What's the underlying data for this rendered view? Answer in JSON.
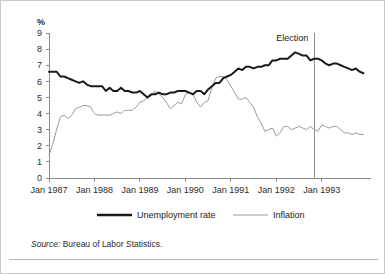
{
  "figure": {
    "y_unit_label": "%",
    "annotation_label": "Election",
    "source_keyword": "Source:",
    "source_text": "Bureau of Labor Statistics."
  },
  "legend": {
    "position": "below-axis",
    "entries": [
      {
        "label": "Unemployment rate",
        "color": "#1a1a1a",
        "style": "thick-solid"
      },
      {
        "label": "Inflation",
        "color": "#9a9a9a",
        "style": "thin-solid"
      }
    ]
  },
  "chart_data": {
    "type": "line",
    "title": "",
    "subtitle": "",
    "xlabel": "",
    "ylabel": "%",
    "ylim": [
      0,
      9
    ],
    "yticks": [
      0,
      1,
      2,
      3,
      4,
      5,
      6,
      7,
      8,
      9
    ],
    "ytick_labels": [
      "0",
      "1",
      "2",
      "3",
      "4",
      "5",
      "6",
      "7",
      "8",
      "9"
    ],
    "xlim": [
      "1987-01",
      "1993-12"
    ],
    "xticks": [
      "1987-01",
      "1988-01",
      "1989-01",
      "1990-01",
      "1991-01",
      "1992-01",
      "1993-01"
    ],
    "xtick_labels": [
      "Jan 1987",
      "Jan 1988",
      "Jan 1989",
      "Jan 1990",
      "Jan 1991",
      "Jan 1992",
      "Jan 1993"
    ],
    "grid": false,
    "legend_position": "bottom",
    "annotations": [
      {
        "label": "Election",
        "type": "vertical-line",
        "x": "1992-11",
        "color": "#8f8f8f"
      }
    ],
    "x": [
      "1987-01",
      "1987-02",
      "1987-03",
      "1987-04",
      "1987-05",
      "1987-06",
      "1987-07",
      "1987-08",
      "1987-09",
      "1987-10",
      "1987-11",
      "1987-12",
      "1988-01",
      "1988-02",
      "1988-03",
      "1988-04",
      "1988-05",
      "1988-06",
      "1988-07",
      "1988-08",
      "1988-09",
      "1988-10",
      "1988-11",
      "1988-12",
      "1989-01",
      "1989-02",
      "1989-03",
      "1989-04",
      "1989-05",
      "1989-06",
      "1989-07",
      "1989-08",
      "1989-09",
      "1989-10",
      "1989-11",
      "1989-12",
      "1990-01",
      "1990-02",
      "1990-03",
      "1990-04",
      "1990-05",
      "1990-06",
      "1990-07",
      "1990-08",
      "1990-09",
      "1990-10",
      "1990-11",
      "1990-12",
      "1991-01",
      "1991-02",
      "1991-03",
      "1991-04",
      "1991-05",
      "1991-06",
      "1991-07",
      "1991-08",
      "1991-09",
      "1991-10",
      "1991-11",
      "1991-12",
      "1992-01",
      "1992-02",
      "1992-03",
      "1992-04",
      "1992-05",
      "1992-06",
      "1992-07",
      "1992-08",
      "1992-09",
      "1992-10",
      "1992-11",
      "1992-12",
      "1993-01",
      "1993-02",
      "1993-03",
      "1993-04",
      "1993-05",
      "1993-06",
      "1993-07",
      "1993-08",
      "1993-09",
      "1993-10",
      "1993-11",
      "1993-12"
    ],
    "series": [
      {
        "name": "Unemployment rate",
        "color": "#1a1a1a",
        "values": [
          6.6,
          6.6,
          6.6,
          6.3,
          6.3,
          6.2,
          6.1,
          6.0,
          5.9,
          6.0,
          5.8,
          5.7,
          5.7,
          5.7,
          5.7,
          5.4,
          5.6,
          5.4,
          5.4,
          5.6,
          5.4,
          5.4,
          5.3,
          5.3,
          5.4,
          5.2,
          5.0,
          5.2,
          5.2,
          5.3,
          5.2,
          5.2,
          5.3,
          5.3,
          5.4,
          5.4,
          5.4,
          5.3,
          5.2,
          5.4,
          5.4,
          5.2,
          5.5,
          5.7,
          5.9,
          5.9,
          6.2,
          6.3,
          6.4,
          6.6,
          6.8,
          6.7,
          6.9,
          6.9,
          6.8,
          6.9,
          6.9,
          7.0,
          7.0,
          7.3,
          7.3,
          7.4,
          7.4,
          7.4,
          7.6,
          7.8,
          7.7,
          7.6,
          7.6,
          7.3,
          7.4,
          7.4,
          7.3,
          7.1,
          7.0,
          7.1,
          7.1,
          7.0,
          6.9,
          6.8,
          6.7,
          6.8,
          6.6,
          6.5
        ]
      },
      {
        "name": "Inflation",
        "color": "#9a9a9a",
        "values": [
          1.4,
          2.1,
          3.0,
          3.8,
          3.9,
          3.7,
          3.9,
          4.3,
          4.4,
          4.5,
          4.5,
          4.4,
          4.0,
          3.9,
          3.9,
          3.9,
          3.9,
          4.0,
          4.1,
          4.0,
          4.2,
          4.2,
          4.2,
          4.4,
          4.7,
          4.8,
          5.0,
          5.1,
          5.4,
          5.2,
          5.0,
          4.7,
          4.3,
          4.5,
          4.7,
          4.6,
          5.2,
          5.3,
          5.2,
          4.7,
          4.4,
          4.7,
          4.8,
          5.6,
          6.2,
          6.3,
          6.3,
          6.1,
          5.7,
          5.3,
          4.9,
          4.9,
          5.0,
          4.7,
          4.4,
          3.8,
          3.4,
          2.9,
          3.0,
          3.1,
          2.6,
          2.8,
          3.2,
          3.2,
          3.0,
          3.1,
          3.2,
          3.1,
          3.0,
          3.2,
          3.0,
          2.9,
          3.3,
          3.2,
          3.1,
          3.2,
          3.2,
          3.0,
          2.8,
          2.8,
          2.7,
          2.8,
          2.7,
          2.7
        ]
      }
    ]
  }
}
